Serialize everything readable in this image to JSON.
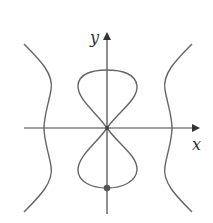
{
  "figure": {
    "axes": {
      "x_label": "x",
      "y_label": "y"
    },
    "colors": {
      "curve": "#666666",
      "axis": "#444444",
      "point": "#555555",
      "background": "#ffffff"
    },
    "elements": {
      "figure_eight": "lemniscate-like closed curve with loops above and below origin, crossing at origin",
      "left_branch": "wavy open curve on the left, crossing the x-axis",
      "right_branch": "wavy open curve on the right, crossing the x-axis",
      "marked_point": "filled dot at the bottom of the lower loop on the y-axis"
    }
  }
}
